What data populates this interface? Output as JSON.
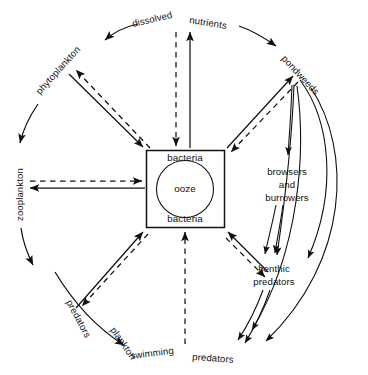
{
  "diagram": {
    "type": "cycle-diagram",
    "colors": {
      "ink": "#111111",
      "background": "#ffffff"
    },
    "center": {
      "box_label_top": "bacteria",
      "box_label_bottom": "bacteria",
      "circle_label": "ooze"
    },
    "ring_labels": [
      {
        "id": "dissolved",
        "text": "dissolved",
        "position": "top-left-of-top"
      },
      {
        "id": "nutrients",
        "text": "nutrients",
        "position": "top-right-of-top"
      },
      {
        "id": "pondweeds",
        "text": "pondweeds",
        "position": "upper-right"
      },
      {
        "id": "phytoplankton",
        "text": "phytoplankton",
        "position": "upper-left"
      },
      {
        "id": "zooplankton",
        "text": "zooplankton",
        "position": "left"
      },
      {
        "id": "predators-left",
        "text": "predators",
        "position": "lower-left-outer"
      },
      {
        "id": "plankton",
        "text": "plankton",
        "position": "lower-left-inner"
      },
      {
        "id": "swimming",
        "text": "swimming",
        "position": "bottom-left"
      },
      {
        "id": "predators-bottom",
        "text": "predators",
        "position": "bottom-right"
      },
      {
        "id": "browsers-line1",
        "text": "browsers",
        "position": "right"
      },
      {
        "id": "browsers-line2",
        "text": "and",
        "position": "right"
      },
      {
        "id": "browsers-line3",
        "text": "burrowers",
        "position": "right"
      },
      {
        "id": "benthic-line1",
        "text": "benthic",
        "position": "lower-right"
      },
      {
        "id": "benthic-line2",
        "text": "predators",
        "position": "lower-right"
      }
    ],
    "legend_note": {
      "solid": "solid arrows",
      "dashed": "dashed arrows"
    }
  }
}
